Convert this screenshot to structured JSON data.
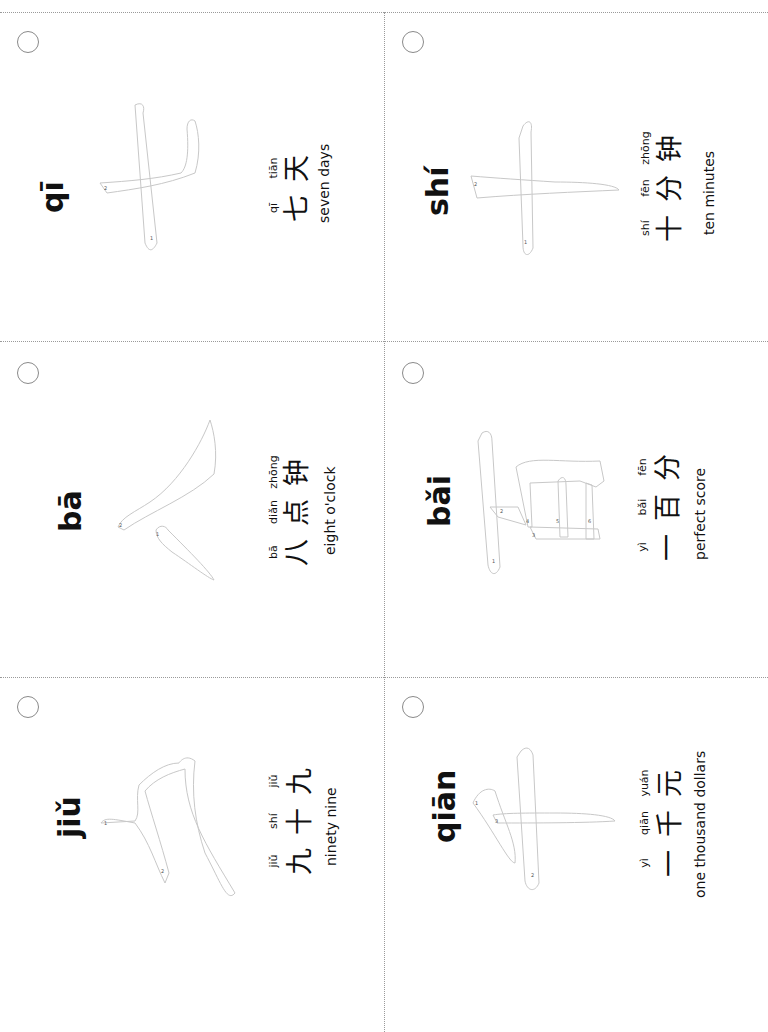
{
  "sheet": {
    "orientation": "rotated-90-ccw",
    "grid": {
      "columns": 2,
      "rows": 3
    },
    "line_color": "#9a9a9a",
    "outline_color": "#c8c8c8"
  },
  "cards": [
    {
      "position": "row1-col1",
      "title": "qī",
      "character": "七",
      "stroke_numbers": [
        "1",
        "2"
      ],
      "example": {
        "pinyin": [
          "qī",
          "tiān"
        ],
        "hanzi": [
          "七",
          "天"
        ],
        "english": "seven days"
      }
    },
    {
      "position": "row1-col2",
      "title": "shí",
      "character": "十",
      "stroke_numbers": [
        "1",
        "2"
      ],
      "example": {
        "pinyin": [
          "shí",
          "fēn",
          "zhōng"
        ],
        "hanzi": [
          "十",
          "分",
          "钟"
        ],
        "english": "ten minutes"
      }
    },
    {
      "position": "row2-col1",
      "title": "bā",
      "character": "八",
      "stroke_numbers": [
        "1",
        "2"
      ],
      "example": {
        "pinyin": [
          "bā",
          "diǎn",
          "zhōng"
        ],
        "hanzi": [
          "八",
          "点",
          "钟"
        ],
        "english": "eight o'clock"
      }
    },
    {
      "position": "row2-col2",
      "title": "bǎi",
      "character": "百",
      "stroke_numbers": [
        "1",
        "2",
        "3",
        "4",
        "5",
        "6"
      ],
      "example": {
        "pinyin": [
          "yì",
          "bǎi",
          "fēn"
        ],
        "hanzi": [
          "一",
          "百",
          "分"
        ],
        "english": "perfect score"
      }
    },
    {
      "position": "row3-col1",
      "title": "jiǔ",
      "character": "九",
      "stroke_numbers": [
        "1",
        "2"
      ],
      "example": {
        "pinyin": [
          "jiǔ",
          "shí",
          "jiǔ"
        ],
        "hanzi": [
          "九",
          "十",
          "九"
        ],
        "english": "ninety nine"
      }
    },
    {
      "position": "row3-col2",
      "title": "qiān",
      "character": "千",
      "stroke_numbers": [
        "1",
        "2",
        "3"
      ],
      "example": {
        "pinyin": [
          "yì",
          "qiān",
          "yuán"
        ],
        "hanzi": [
          "一",
          "千",
          "元"
        ],
        "english": "one thousand dollars"
      }
    }
  ]
}
